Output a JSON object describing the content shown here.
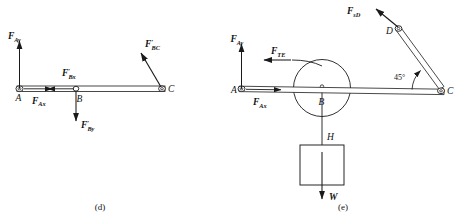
{
  "figure": {
    "panels": [
      {
        "id": "d",
        "caption": "(d)",
        "points": [
          {
            "name": "A",
            "label": "A"
          },
          {
            "name": "B",
            "label": "B"
          },
          {
            "name": "C",
            "label": "C"
          }
        ],
        "forces": [
          {
            "name": "F_Ay",
            "base": "F",
            "sub": "Ay",
            "prime": "",
            "direction": "up"
          },
          {
            "name": "F_Ax",
            "base": "F",
            "sub": "Ax",
            "prime": "",
            "direction": "right"
          },
          {
            "name": "F_Bx_prime",
            "base": "F",
            "sub": "Bx",
            "prime": "′",
            "direction": "left"
          },
          {
            "name": "F_By_prime",
            "base": "F",
            "sub": "By",
            "prime": "′",
            "direction": "down"
          },
          {
            "name": "F_BC_prime",
            "base": "F",
            "sub": "BC",
            "prime": "′",
            "direction": "up-left"
          }
        ]
      },
      {
        "id": "e",
        "caption": "(e)",
        "points": [
          {
            "name": "A",
            "label": "A"
          },
          {
            "name": "B",
            "label": "B"
          },
          {
            "name": "C",
            "label": "C"
          },
          {
            "name": "D",
            "label": "D"
          },
          {
            "name": "H",
            "label": "H"
          }
        ],
        "forces": [
          {
            "name": "F_Ay",
            "base": "F",
            "sub": "Ay",
            "prime": "",
            "direction": "up"
          },
          {
            "name": "F_Ax",
            "base": "F",
            "sub": "Ax",
            "prime": "",
            "direction": "right"
          },
          {
            "name": "F_TE",
            "base": "F",
            "sub": "TE",
            "prime": "",
            "direction": "left"
          },
          {
            "name": "F_sD",
            "base": "F",
            "sub": "sD",
            "prime": "",
            "direction": "up-left"
          },
          {
            "name": "W",
            "base": "W",
            "sub": "",
            "prime": "",
            "direction": "down"
          }
        ],
        "angle": {
          "name": "angle-at-C",
          "value": "45°"
        }
      }
    ],
    "colors": {
      "line": "#1a1a1a",
      "background": "#ffffff"
    }
  }
}
